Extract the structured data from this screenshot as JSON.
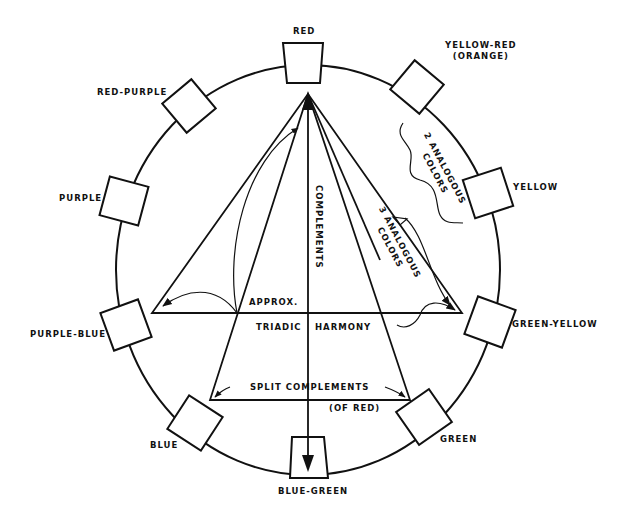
{
  "diagram": {
    "type": "color-wheel-harmony",
    "colors": [
      {
        "name": "RED"
      },
      {
        "name": "YELLOW-RED",
        "sub": "(ORANGE)"
      },
      {
        "name": "YELLOW"
      },
      {
        "name": "GREEN-YELLOW"
      },
      {
        "name": "GREEN"
      },
      {
        "name": "BLUE-GREEN"
      },
      {
        "name": "BLUE"
      },
      {
        "name": "PURPLE-BLUE"
      },
      {
        "name": "PURPLE"
      },
      {
        "name": "RED-PURPLE"
      }
    ],
    "annotations": {
      "complements": "COMPLEMENTS",
      "approx": "APPROX.",
      "triadic": "TRIADIC",
      "harmony": "HARMONY",
      "split_complements": "SPLIT COMPLEMENTS",
      "of_red": "(OF RED)",
      "two_analogous_1": "2 ANALOGOUS",
      "two_analogous_2": "COLORS",
      "three_analogous_1": "3 ANALOGOUS",
      "three_analogous_2": "COLORS"
    },
    "stroke_color": "#111111",
    "background": "#ffffff"
  }
}
